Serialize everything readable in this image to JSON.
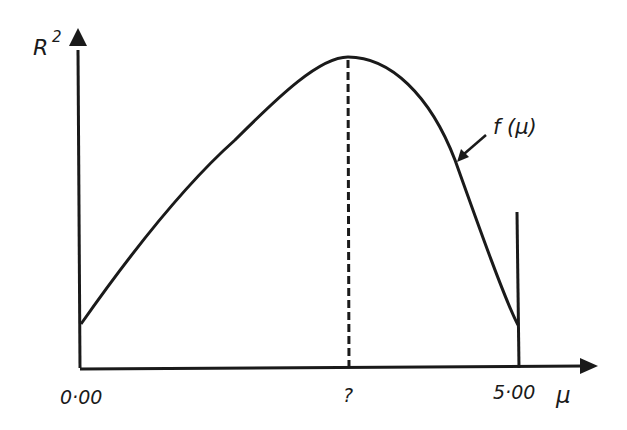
{
  "diagram": {
    "type": "function-curve",
    "y_axis": {
      "label": "R",
      "label_superscript": "2"
    },
    "x_axis": {
      "label": "μ",
      "ticks": [
        {
          "value": "0·00",
          "position": "origin"
        },
        {
          "value": "?",
          "position": "maximum"
        },
        {
          "value": "5·00",
          "position": "end"
        }
      ]
    },
    "curve": {
      "label": "f (μ)",
      "shape": "single-peaked",
      "start": "μ = 0·00",
      "peak": "μ = ?",
      "end": "μ = 5·00"
    },
    "markers": {
      "peak_line": "dashed vertical line at maximum",
      "end_line": "solid vertical line at μ = 5·00"
    },
    "colors": {
      "ink": "#1a1a1a",
      "background": "#ffffff"
    }
  }
}
